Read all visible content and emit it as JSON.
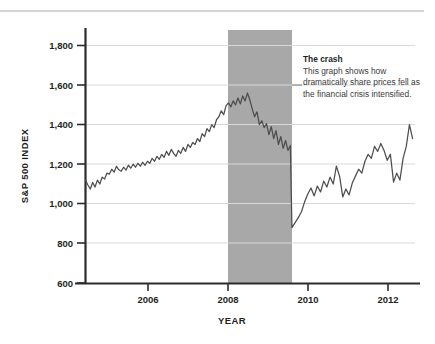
{
  "annotation": {
    "title": "The crash",
    "body": "This graph shows how dramatically share prices fell as the financial crisis intensified."
  },
  "colors": {
    "line": "#4d4d4d",
    "shaded_band": "#a8a8a8",
    "grid": "#d9d9d9",
    "axis": "#2b2b2b",
    "top_rule": "#d5d5d5",
    "text": "#231f20",
    "annotation_body": "#3a3a3a",
    "background": "#ffffff"
  },
  "chart_data": {
    "type": "line",
    "title": "",
    "xlabel": "YEAR",
    "ylabel": "S&P 500 INDEX",
    "xlim": [
      2004.4,
      2012.7
    ],
    "ylim": [
      600,
      1900
    ],
    "yticks": [
      600,
      800,
      1000,
      1200,
      1400,
      1600,
      1800
    ],
    "ytick_labels": [
      "600",
      "800",
      "1,000",
      "1,200",
      "1,400",
      "1,600",
      "1,800"
    ],
    "xticks": [
      2006,
      2008,
      2010,
      2012
    ],
    "xtick_labels": [
      "2006",
      "2008",
      "2010",
      "2012"
    ],
    "grid": "horizontal",
    "legend": "none",
    "shaded_region": {
      "label": "crash period",
      "x_start": 2008.0,
      "x_end": 2009.6,
      "y_start": 600,
      "y_end": 1900
    },
    "series": [
      {
        "name": "S&P 500 Index",
        "x": [
          2004.4,
          2004.46,
          2004.52,
          2004.58,
          2004.64,
          2004.7,
          2004.76,
          2004.82,
          2004.88,
          2004.94,
          2005.0,
          2005.06,
          2005.12,
          2005.18,
          2005.24,
          2005.3,
          2005.36,
          2005.42,
          2005.48,
          2005.54,
          2005.6,
          2005.66,
          2005.72,
          2005.78,
          2005.84,
          2005.9,
          2005.96,
          2006.02,
          2006.08,
          2006.14,
          2006.2,
          2006.26,
          2006.32,
          2006.38,
          2006.44,
          2006.5,
          2006.56,
          2006.62,
          2006.68,
          2006.74,
          2006.8,
          2006.86,
          2006.92,
          2006.98,
          2007.04,
          2007.1,
          2007.16,
          2007.22,
          2007.28,
          2007.34,
          2007.4,
          2007.46,
          2007.52,
          2007.58,
          2007.64,
          2007.7,
          2007.76,
          2007.82,
          2007.88,
          2007.94,
          2008.0,
          2008.06,
          2008.12,
          2008.18,
          2008.24,
          2008.3,
          2008.36,
          2008.42,
          2008.48,
          2008.54,
          2008.6,
          2008.66,
          2008.72,
          2008.78,
          2008.84,
          2008.9,
          2008.96,
          2009.02,
          2009.08,
          2009.14,
          2009.2,
          2009.26,
          2009.32,
          2009.38,
          2009.44,
          2009.5,
          2009.56,
          2009.62,
          2009.68,
          2009.74,
          2009.8,
          2009.86,
          2009.92,
          2009.98,
          2010.04,
          2010.1,
          2010.16,
          2010.22,
          2010.28,
          2010.34,
          2010.4,
          2010.46,
          2010.52,
          2010.58,
          2010.64,
          2010.7,
          2010.76,
          2010.82,
          2010.88,
          2010.94,
          2011.0,
          2011.06,
          2011.12,
          2011.18,
          2011.24,
          2011.3,
          2011.36,
          2011.42,
          2011.48,
          2011.54,
          2011.6,
          2011.66,
          2011.72,
          2011.78,
          2011.84,
          2011.9,
          2011.96,
          2012.02,
          2012.08,
          2012.14,
          2012.2,
          2012.26,
          2012.32,
          2012.38,
          2012.44,
          2012.5,
          2012.56,
          2012.62,
          2012.66
        ],
        "y": [
          1120,
          1095,
          1075,
          1108,
          1085,
          1120,
          1100,
          1135,
          1125,
          1155,
          1150,
          1175,
          1160,
          1190,
          1172,
          1165,
          1185,
          1170,
          1195,
          1180,
          1200,
          1185,
          1205,
          1190,
          1210,
          1195,
          1215,
          1205,
          1230,
          1215,
          1240,
          1225,
          1250,
          1235,
          1265,
          1245,
          1275,
          1255,
          1240,
          1270,
          1255,
          1285,
          1265,
          1300,
          1285,
          1310,
          1300,
          1330,
          1315,
          1355,
          1340,
          1380,
          1365,
          1400,
          1385,
          1425,
          1440,
          1470,
          1450,
          1495,
          1510,
          1490,
          1520,
          1500,
          1535,
          1505,
          1545,
          1520,
          1560,
          1525,
          1480,
          1440,
          1465,
          1400,
          1420,
          1385,
          1405,
          1350,
          1390,
          1330,
          1370,
          1300,
          1340,
          1280,
          1320,
          1270,
          1295,
          1240,
          1180,
          1150,
          1230,
          1175,
          1120,
          1060,
          1000,
          960,
          905,
          870,
          930,
          885,
          940,
          870,
          830,
          875,
          845,
          870,
          810,
          760,
          815,
          780,
          800,
          760,
          700,
          680,
          720,
          760,
          800,
          840,
          880,
          860,
          905,
          880,
          920,
          900,
          945,
          930,
          975,
          955,
          1000,
          985,
          1025,
          1005,
          1040,
          1020,
          1060,
          1040,
          1080,
          1060,
          1090
        ]
      }
    ],
    "notable_points": [
      {
        "label": "pre-crisis peak",
        "x": 2007.58,
        "y": 1565
      },
      {
        "label": "crisis trough",
        "x": 2009.12,
        "y": 680
      },
      {
        "label": "recovery high",
        "x": 2012.28,
        "y": 1405
      }
    ]
  },
  "series_extension": {
    "name": "S&P 500 Index (recovery tail)",
    "x": [
      2009.6,
      2009.68,
      2009.76,
      2009.84,
      2009.92,
      2010.0,
      2010.08,
      2010.16,
      2010.24,
      2010.32,
      2010.4,
      2010.48,
      2010.56,
      2010.64,
      2010.72,
      2010.8,
      2010.88,
      2010.96,
      2011.04,
      2011.12,
      2011.2,
      2011.28,
      2011.36,
      2011.44,
      2011.52,
      2011.6,
      2011.68,
      2011.76,
      2011.84,
      2011.92,
      2012.0,
      2012.08,
      2012.16,
      2012.24,
      2012.32,
      2012.4,
      2012.48,
      2012.56,
      2012.64
    ],
    "y": [
      880,
      905,
      930,
      960,
      1010,
      1050,
      1080,
      1040,
      1090,
      1060,
      1115,
      1085,
      1135,
      1100,
      1190,
      1140,
      1035,
      1075,
      1045,
      1105,
      1140,
      1175,
      1155,
      1215,
      1250,
      1230,
      1290,
      1265,
      1305,
      1270,
      1220,
      1250,
      1110,
      1155,
      1120,
      1230,
      1290,
      1400,
      1330
    ]
  }
}
